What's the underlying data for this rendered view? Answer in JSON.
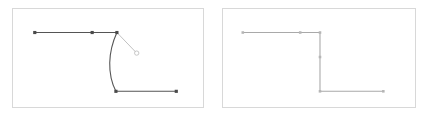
{
  "figure": {
    "width": 431,
    "height": 117,
    "background": "#ffffff",
    "type": "vector-path-editor-comparison",
    "panel_count": 2
  },
  "colors": {
    "panel_border": "#d8d8d8",
    "panel_fill": "#ffffff",
    "path_stroke_dark": "#555555",
    "path_stroke_light": "#a9a9a9",
    "handle_stroke": "#b9b9b9",
    "node_fill_dark": "#4a4a4a",
    "node_fill_light": "#b5b5b5"
  },
  "panels": [
    {
      "id": "left",
      "name": "curved-segment-panel",
      "frame": {
        "x": 12,
        "y": 8,
        "width": 192,
        "height": 100
      },
      "stroke_color": "#555555",
      "stroke_width": 1.1,
      "node_color": "#4a4a4a",
      "node_size": 3.2,
      "path": {
        "description": "horizontal top run, curved bezier drop, horizontal bottom run",
        "segments": [
          {
            "type": "move",
            "x": 22,
            "y": 24
          },
          {
            "type": "line",
            "x": 105,
            "y": 24
          },
          {
            "type": "cubic",
            "c1x": 96,
            "c1y": 44,
            "c2x": 95,
            "c2y": 66,
            "x": 104,
            "y": 84
          },
          {
            "type": "line",
            "x": 165,
            "y": 84
          }
        ],
        "svg_d": "M 22 24 L 105 24 C 96 44 95 66 104 84 L 165 84"
      },
      "nodes": [
        {
          "name": "node-start",
          "x": 22,
          "y": 24,
          "shape": "square",
          "state": "endpoint"
        },
        {
          "name": "node-mid-top",
          "x": 80,
          "y": 24,
          "shape": "square",
          "state": "smooth"
        },
        {
          "name": "node-corner-top",
          "x": 105,
          "y": 24,
          "shape": "square",
          "state": "selected"
        },
        {
          "name": "node-corner-bottom",
          "x": 104,
          "y": 84,
          "shape": "square",
          "state": "smooth"
        },
        {
          "name": "node-end",
          "x": 165,
          "y": 84,
          "shape": "square",
          "state": "endpoint"
        }
      ],
      "control_handle": {
        "name": "bezier-control-handle",
        "from_x": 105,
        "from_y": 24,
        "to_x": 125,
        "to_y": 45,
        "color": "#b9b9b9",
        "knob_radius": 2.2
      }
    },
    {
      "id": "right",
      "name": "corner-segment-panel",
      "frame": {
        "x": 222,
        "y": 8,
        "width": 194,
        "height": 100
      },
      "stroke_color": "#a9a9a9",
      "stroke_width": 1.1,
      "node_color": "#b5b5b5",
      "node_size": 2.6,
      "path": {
        "description": "horizontal top run, vertical straight drop, horizontal bottom run",
        "segments": [
          {
            "type": "move",
            "x": 20,
            "y": 24
          },
          {
            "type": "line",
            "x": 98,
            "y": 24
          },
          {
            "type": "line",
            "x": 98,
            "y": 84
          },
          {
            "type": "line",
            "x": 162,
            "y": 84
          }
        ],
        "svg_d": "M 20 24 L 98 24 L 98 84 L 162 84"
      },
      "nodes": [
        {
          "name": "node-start",
          "x": 20,
          "y": 24,
          "shape": "square",
          "state": "endpoint"
        },
        {
          "name": "node-mid-top",
          "x": 78,
          "y": 24,
          "shape": "square",
          "state": "smooth"
        },
        {
          "name": "node-corner-top",
          "x": 98,
          "y": 24,
          "shape": "square",
          "state": "corner"
        },
        {
          "name": "node-mid-vertical",
          "x": 98,
          "y": 49,
          "shape": "square",
          "state": "smooth"
        },
        {
          "name": "node-corner-bottom",
          "x": 98,
          "y": 84,
          "shape": "square",
          "state": "corner"
        },
        {
          "name": "node-end",
          "x": 162,
          "y": 84,
          "shape": "square",
          "state": "endpoint"
        }
      ],
      "control_handle": null
    }
  ]
}
